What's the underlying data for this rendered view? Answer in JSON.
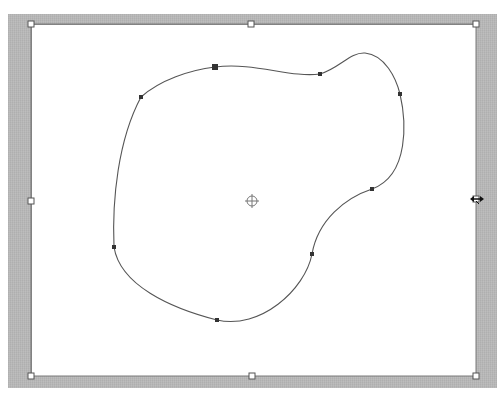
{
  "editor": {
    "tool": "path-transform",
    "colors": {
      "frame": "#b8b8b8",
      "canvas": "#ffffff",
      "path_stroke": "#555555",
      "anchor_fill": "#333333",
      "handle_fill": "#ffffff",
      "handle_stroke": "#555555"
    }
  },
  "bounding_box": {
    "x": 31,
    "y": 24,
    "width": 445,
    "height": 352,
    "handles": [
      {
        "name": "top-left",
        "x": 31,
        "y": 24
      },
      {
        "name": "top-center",
        "x": 251,
        "y": 24
      },
      {
        "name": "top-right",
        "x": 476,
        "y": 24
      },
      {
        "name": "middle-left",
        "x": 31,
        "y": 201
      },
      {
        "name": "middle-right",
        "x": 476,
        "y": 199
      },
      {
        "name": "bottom-left",
        "x": 31,
        "y": 376
      },
      {
        "name": "bottom-center",
        "x": 252,
        "y": 376
      },
      {
        "name": "bottom-right",
        "x": 476,
        "y": 376
      }
    ]
  },
  "path": {
    "closed": true,
    "anchors": [
      {
        "x": 215,
        "y": 67,
        "selected": true
      },
      {
        "x": 320,
        "y": 74,
        "selected": false
      },
      {
        "x": 400,
        "y": 94,
        "selected": false
      },
      {
        "x": 372,
        "y": 189,
        "selected": false
      },
      {
        "x": 312,
        "y": 254,
        "selected": false
      },
      {
        "x": 217,
        "y": 320,
        "selected": false
      },
      {
        "x": 114,
        "y": 247,
        "selected": false
      },
      {
        "x": 141,
        "y": 97,
        "selected": false
      }
    ]
  },
  "center_point": {
    "x": 252,
    "y": 201,
    "icon": "crosshair-icon"
  },
  "cursor": {
    "x": 477,
    "y": 199,
    "icon": "horizontal-resize-cursor"
  }
}
